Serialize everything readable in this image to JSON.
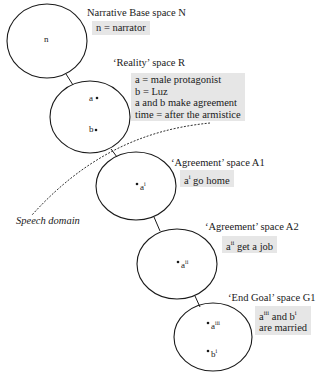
{
  "diagram": {
    "spaces": [
      {
        "id": "N",
        "title": "Narrative Base space N",
        "elements": [
          {
            "label": "n",
            "sup": ""
          }
        ],
        "notes": [
          "n = narrator"
        ]
      },
      {
        "id": "R",
        "title": "‘Reality’ space R",
        "elements": [
          {
            "label": "a",
            "sup": ""
          },
          {
            "label": "b",
            "sup": ""
          }
        ],
        "notes": [
          "a =  male protagonist",
          "b =  Luz",
          "a and b make agreement",
          "time = after the armistice"
        ]
      },
      {
        "id": "A1",
        "title": "‘Agreement’ space A1",
        "elements": [
          {
            "label": "a",
            "sup": "i"
          }
        ],
        "notes": [
          {
            "base": "a",
            "sup": "i",
            "text": " go home"
          }
        ]
      },
      {
        "id": "A2",
        "title": "‘Agreement’ space A2",
        "elements": [
          {
            "label": "a",
            "sup": "ii"
          }
        ],
        "notes": [
          {
            "base": "a",
            "sup": "ii",
            "text": " get a job"
          }
        ]
      },
      {
        "id": "G1",
        "title": "‘End Goal’ space G1",
        "elements": [
          {
            "label": "a",
            "sup": "iii"
          },
          {
            "label": "b",
            "sup": "i"
          }
        ],
        "notes": [
          {
            "base1": "a",
            "sup1": "iii",
            "mid": " and b",
            "sup2": "i",
            "line2": "are married"
          }
        ]
      }
    ],
    "speech_domain_label": "Speech domain",
    "colors": {
      "line": "#1a1a1a",
      "note_box": "#e6e6e6",
      "background": "#ffffff"
    }
  }
}
